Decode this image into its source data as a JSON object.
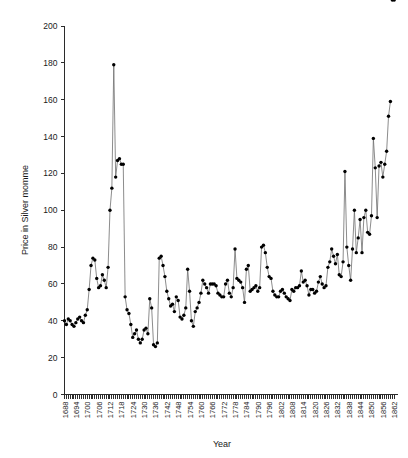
{
  "chart_data": {
    "type": "line",
    "title": "",
    "xlabel": "Year",
    "ylabel": "Price in Silver momme",
    "xlim": [
      1688,
      1864
    ],
    "ylim": [
      0,
      200
    ],
    "yticks": [
      0,
      20,
      40,
      60,
      80,
      100,
      120,
      140,
      160,
      180,
      200
    ],
    "xticks": [
      1688,
      1694,
      1700,
      1706,
      1712,
      1718,
      1724,
      1730,
      1736,
      1742,
      1748,
      1754,
      1760,
      1766,
      1772,
      1778,
      1784,
      1790,
      1796,
      1802,
      1808,
      1814,
      1820,
      1826,
      1832,
      1838,
      1844,
      1850,
      1856,
      1862
    ],
    "grid": false,
    "legend": false,
    "marker": "filled-circle",
    "line_color": "#6f6f6f",
    "marker_color": "#000000",
    "x": [
      1688,
      1689,
      1690,
      1691,
      1692,
      1693,
      1694,
      1695,
      1696,
      1697,
      1698,
      1699,
      1700,
      1701,
      1702,
      1703,
      1704,
      1705,
      1706,
      1707,
      1708,
      1709,
      1710,
      1711,
      1712,
      1713,
      1714,
      1715,
      1716,
      1717,
      1718,
      1719,
      1720,
      1721,
      1722,
      1723,
      1724,
      1725,
      1726,
      1727,
      1728,
      1729,
      1730,
      1731,
      1732,
      1733,
      1734,
      1735,
      1736,
      1737,
      1738,
      1739,
      1740,
      1741,
      1742,
      1743,
      1744,
      1745,
      1746,
      1747,
      1748,
      1749,
      1750,
      1751,
      1752,
      1753,
      1754,
      1755,
      1756,
      1757,
      1758,
      1759,
      1760,
      1761,
      1762,
      1763,
      1764,
      1765,
      1766,
      1767,
      1768,
      1769,
      1770,
      1771,
      1772,
      1773,
      1774,
      1775,
      1776,
      1777,
      1778,
      1779,
      1780,
      1781,
      1782,
      1783,
      1784,
      1785,
      1786,
      1787,
      1788,
      1789,
      1790,
      1791,
      1792,
      1793,
      1794,
      1795,
      1796,
      1797,
      1798,
      1799,
      1800,
      1801,
      1802,
      1803,
      1804,
      1805,
      1806,
      1807,
      1808,
      1809,
      1810,
      1811,
      1812,
      1813,
      1814,
      1815,
      1816,
      1817,
      1818,
      1819,
      1820,
      1821,
      1822,
      1823,
      1824,
      1825,
      1826,
      1827,
      1828,
      1829,
      1830,
      1831,
      1832,
      1833,
      1834,
      1835,
      1836,
      1837,
      1838,
      1839,
      1840,
      1841,
      1842,
      1843,
      1844,
      1845,
      1846,
      1847,
      1848,
      1849,
      1850,
      1851,
      1852,
      1853,
      1854,
      1855,
      1856,
      1857,
      1858,
      1859,
      1860,
      1861,
      1862
    ],
    "y": [
      40,
      38,
      41,
      40,
      38,
      37,
      39,
      41,
      42,
      40,
      39,
      43,
      46,
      57,
      70,
      74,
      73,
      63,
      58,
      59,
      65,
      62,
      58,
      69,
      100,
      112,
      179,
      118,
      127,
      128,
      125,
      125,
      53,
      46,
      44,
      38,
      31,
      33,
      35,
      30,
      28,
      30,
      35,
      36,
      33,
      52,
      47,
      27,
      26,
      28,
      74,
      75,
      70,
      64,
      56,
      52,
      48,
      49,
      45,
      53,
      51,
      42,
      41,
      43,
      47,
      68,
      56,
      40,
      37,
      45,
      47,
      50,
      55,
      62,
      60,
      58,
      55,
      60,
      60,
      60,
      59,
      55,
      54,
      53,
      53,
      60,
      62,
      55,
      53,
      58,
      79,
      63,
      62,
      61,
      58,
      50,
      68,
      70,
      56,
      57,
      58,
      59,
      56,
      58,
      80,
      81,
      77,
      69,
      64,
      63,
      56,
      54,
      53,
      53,
      56,
      57,
      55,
      53,
      52,
      51,
      57,
      56,
      58,
      58,
      59,
      67,
      61,
      62,
      59,
      54,
      57,
      57,
      55,
      56,
      61,
      64,
      60,
      58,
      59,
      69,
      72,
      79,
      75,
      71,
      76,
      65,
      64,
      72,
      121,
      80,
      70,
      62,
      79,
      100,
      77,
      85,
      95,
      77,
      96,
      100,
      88,
      87,
      97,
      139,
      123,
      96,
      124,
      126,
      118,
      125,
      132,
      151,
      159
    ]
  }
}
